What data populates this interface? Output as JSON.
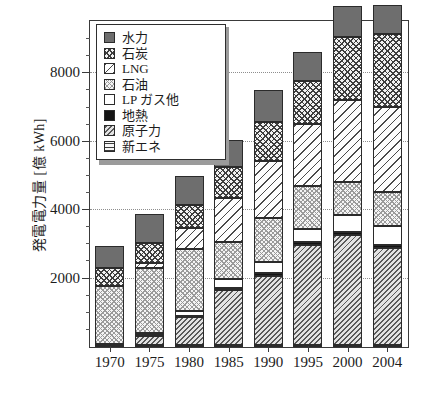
{
  "chart_data": {
    "type": "bar",
    "subtype": "stacked-bar",
    "title": "",
    "xlabel": "",
    "ylabel": "発電電力量 [億 kWh]",
    "categories": [
      "1970",
      "1975",
      "1980",
      "1985",
      "1990",
      "1995",
      "2000",
      "2004"
    ],
    "ylim": [
      0,
      9500
    ],
    "yticks": [
      2000,
      4000,
      6000,
      8000
    ],
    "ytick_labels": [
      "2000",
      "4000",
      "6000",
      "8000"
    ],
    "yminor_step": 500,
    "grid": true,
    "grid_axis": "y",
    "legend_position": "upper-left-inside",
    "stack_order_bottom_to_top": [
      "新エネ",
      "原子力",
      "地熱",
      "LPガス他",
      "石油",
      "LNG",
      "石炭",
      "水力"
    ],
    "series": [
      {
        "name": "新エネ",
        "pattern": "horizontal-lines",
        "values": [
          0,
          60,
          60,
          60,
          60,
          60,
          60,
          60
        ]
      },
      {
        "name": "原子力",
        "pattern": "diagonal-hatch",
        "values": [
          45,
          250,
          830,
          1600,
          2020,
          2910,
          3220,
          2820
        ]
      },
      {
        "name": "地熱",
        "pattern": "solid-black",
        "values": [
          0,
          30,
          30,
          60,
          90,
          90,
          90,
          90
        ]
      },
      {
        "name": "LPガス他",
        "pattern": "white",
        "values": [
          40,
          60,
          120,
          280,
          320,
          400,
          490,
          560
        ]
      },
      {
        "name": "石油",
        "pattern": "fine-stipple",
        "values": [
          1690,
          1900,
          1820,
          1070,
          1280,
          1260,
          950,
          1010
        ]
      },
      {
        "name": "LNG",
        "pattern": "diagonal-lines",
        "values": [
          0,
          160,
          620,
          1290,
          1670,
          1800,
          2420,
          2480
        ]
      },
      {
        "name": "石炭",
        "pattern": "cross-hatch",
        "values": [
          530,
          580,
          680,
          900,
          1130,
          1270,
          1840,
          2130
        ]
      },
      {
        "name": "水力",
        "pattern": "solid-gray",
        "values": [
          640,
          850,
          850,
          800,
          950,
          830,
          910,
          850
        ]
      }
    ],
    "totals": [
      2945,
      3890,
      5010,
      6060,
      7520,
      8620,
      9980,
      10000
    ],
    "bar_totals_plotted": [
      2945,
      3890,
      5010,
      5920,
      7400,
      8570,
      9270,
      9190
    ]
  },
  "legend": {
    "items": [
      {
        "label": "水力",
        "swatch": "solid-gray-swatch"
      },
      {
        "label": "石炭",
        "swatch": "cross-hatch-swatch"
      },
      {
        "label": "LNG",
        "swatch": "diagonal-line-swatch"
      },
      {
        "label": "石油",
        "swatch": "stipple-swatch"
      },
      {
        "label": "LP ガス他",
        "swatch": "white-swatch"
      },
      {
        "label": "地熱",
        "swatch": "solid-black-swatch"
      },
      {
        "label": "原子力",
        "swatch": "diagonal-hatch-swatch"
      },
      {
        "label": "新エネ",
        "swatch": "horizontal-line-swatch"
      }
    ]
  },
  "colors": {
    "hydro": "#6e6e6e",
    "geothermal": "#141414",
    "axis": "#3a3a3a",
    "grid": "#8e8e8e",
    "text": "#1c1c1c",
    "background": "#ffffff"
  }
}
